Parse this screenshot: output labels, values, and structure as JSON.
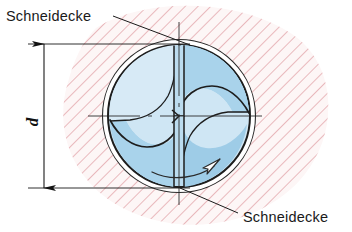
{
  "figure": {
    "type": "technical-drawing",
    "language": "de",
    "width": 352,
    "height": 232,
    "background": "#ffffff"
  },
  "labels": {
    "top_callout": "Schneidecke",
    "bottom_callout": "Schneidecke",
    "dimension_d": "d"
  },
  "callouts": [
    {
      "name": "top-callout",
      "text": "Schneidecke",
      "text_x": 6,
      "text_y": 20,
      "leader": {
        "x1": 113,
        "y1": 16,
        "x2": 188,
        "y2": 44
      }
    },
    {
      "name": "bottom-callout",
      "text": "Schneidecke",
      "text_x": 242,
      "text_y": 222,
      "leader": {
        "x1": 238,
        "y1": 214,
        "x2": 181,
        "y2": 188
      }
    }
  ],
  "dimension": {
    "name": "diameter-d",
    "label": "d",
    "label_x": 38,
    "label_y": 122,
    "line_x": 44,
    "y_top": 44,
    "y_bottom": 188,
    "ext_top_y": 44,
    "ext_bottom_y": 188,
    "ext_x_start": 28,
    "ext_x_end": 190
  },
  "geometry": {
    "drill": {
      "cx": 179,
      "cy": 116,
      "r": 71
    },
    "bore": {
      "cx": 179,
      "cy": 116,
      "r": 76
    },
    "center_marks": {
      "horizontal_y": 116,
      "vertical_x": 179
    },
    "rotation_arrow": {
      "direction": "clockwise",
      "tip_x": 216,
      "tip_y": 163
    }
  },
  "colors": {
    "flute_fill_light": "#cfe6f4",
    "flute_fill_mid": "#a7d2ea",
    "flute_fill_dark": "#8cc4e2",
    "outline": "#1d1d1d",
    "hatch": "#d8868c",
    "hatch_region_tint": "#fdf3f3",
    "clearance_gap": "#ffffff",
    "text": "#1a1a1a",
    "centerline": "#2b2b2b"
  },
  "hatching": {
    "name": "workpiece-section-hatch",
    "angle_deg": 45,
    "spacing_px": 9,
    "stroke_width": 1.1,
    "color": "#d8868c"
  }
}
